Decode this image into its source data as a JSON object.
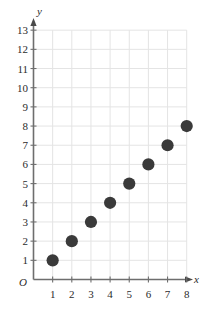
{
  "chart_data": {
    "type": "scatter",
    "title": "",
    "xlabel": "x",
    "ylabel": "y",
    "origin_label": "O",
    "x": [
      1,
      2,
      3,
      4,
      5,
      6,
      7,
      8
    ],
    "values": [
      1,
      2,
      3,
      4,
      5,
      6,
      7,
      8
    ],
    "series": [
      {
        "name": "",
        "points": [
          {
            "x": 1,
            "y": 1
          },
          {
            "x": 2,
            "y": 2
          },
          {
            "x": 3,
            "y": 3
          },
          {
            "x": 4,
            "y": 4
          },
          {
            "x": 5,
            "y": 5
          },
          {
            "x": 6,
            "y": 6
          },
          {
            "x": 7,
            "y": 7
          },
          {
            "x": 8,
            "y": 8
          }
        ]
      }
    ],
    "xlim": [
      0,
      8
    ],
    "ylim": [
      0,
      13
    ],
    "xticks": [
      1,
      2,
      3,
      4,
      5,
      6,
      7,
      8
    ],
    "yticks": [
      1,
      2,
      3,
      4,
      5,
      6,
      7,
      8,
      9,
      10,
      11,
      12,
      13
    ],
    "xtick_labels": [
      "1",
      "2",
      "3",
      "4",
      "5",
      "6",
      "7",
      "8"
    ],
    "ytick_labels": [
      "1",
      "2",
      "3",
      "4",
      "5",
      "6",
      "7",
      "8",
      "9",
      "10",
      "11",
      "12",
      "13"
    ],
    "grid": true,
    "legend": null,
    "marker": "filled-circle",
    "colors": {
      "marker": "#3a3a3a",
      "grid": "#e4e4e4",
      "axis": "#6e6e6e",
      "text": "#2b2b2b",
      "background": "#ffffff"
    }
  }
}
